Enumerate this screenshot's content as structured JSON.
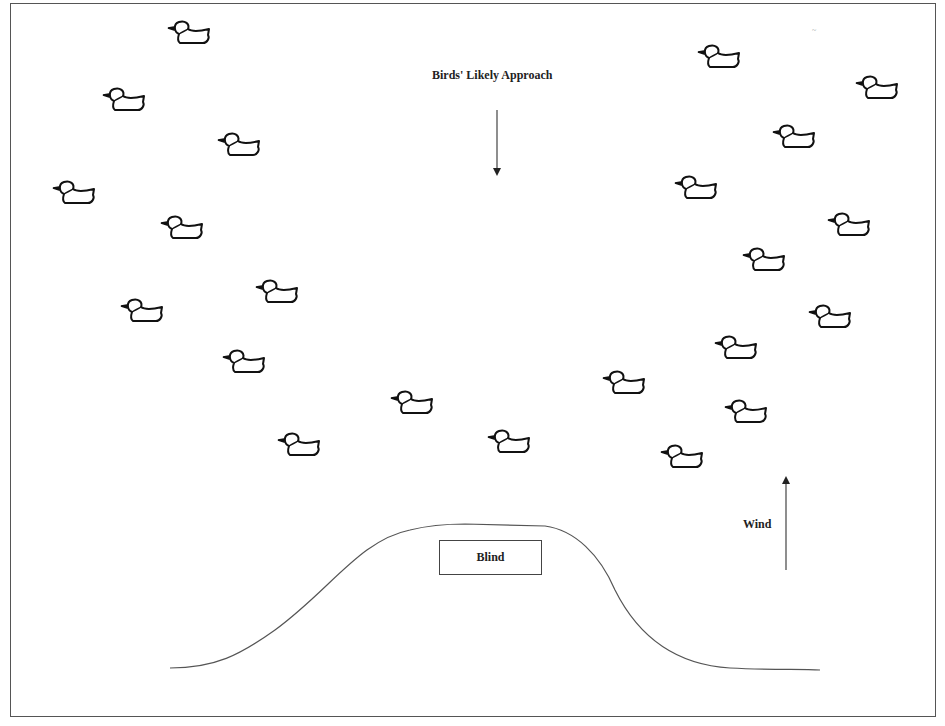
{
  "labels": {
    "approach": "Birds' Likely Approach",
    "wind": "Wind",
    "blind": "Blind",
    "scribble": "~"
  },
  "colors": {
    "line": "#444444",
    "duck_stroke": "#111111",
    "background": "#ffffff"
  },
  "ducks": {
    "left_group": [
      {
        "x": 165,
        "y": 18
      },
      {
        "x": 100,
        "y": 85
      },
      {
        "x": 215,
        "y": 130
      },
      {
        "x": 50,
        "y": 178
      },
      {
        "x": 158,
        "y": 213
      },
      {
        "x": 253,
        "y": 277
      },
      {
        "x": 118,
        "y": 296
      },
      {
        "x": 220,
        "y": 347
      },
      {
        "x": 275,
        "y": 430
      },
      {
        "x": 388,
        "y": 388
      },
      {
        "x": 485,
        "y": 427
      }
    ],
    "right_group": [
      {
        "x": 695,
        "y": 42
      },
      {
        "x": 853,
        "y": 73
      },
      {
        "x": 770,
        "y": 122
      },
      {
        "x": 672,
        "y": 173
      },
      {
        "x": 825,
        "y": 210
      },
      {
        "x": 740,
        "y": 245
      },
      {
        "x": 806,
        "y": 302
      },
      {
        "x": 712,
        "y": 333
      },
      {
        "x": 600,
        "y": 368
      },
      {
        "x": 722,
        "y": 397
      },
      {
        "x": 658,
        "y": 442
      }
    ],
    "facing": "left",
    "count": 22
  },
  "arrows": {
    "approach": {
      "direction": "down",
      "x": 497,
      "y1": 110,
      "y2": 172
    },
    "wind": {
      "direction": "up",
      "x": 786,
      "y1": 570,
      "y2": 480
    }
  }
}
